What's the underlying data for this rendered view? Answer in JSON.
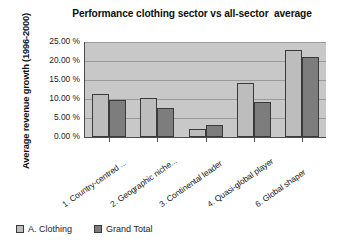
{
  "chart_data": {
    "type": "bar",
    "title": "Performance clothing sector vs all-sector  average",
    "xlabel": "",
    "ylabel": "Average revenue growth (1996-2000)",
    "categories": [
      "1. Country-centred ...",
      "2. Geographic niche...",
      "3. Continental leader",
      "4. Quasi-global player",
      "6. Global shaper"
    ],
    "series": [
      {
        "name": "A. Clothing",
        "color": "#bdbdbd",
        "values": [
          11.3,
          10.2,
          2.0,
          14.2,
          23.0
        ]
      },
      {
        "name": "Grand Total",
        "color": "#7d7d7d",
        "values": [
          9.7,
          7.7,
          3.2,
          9.3,
          21.0
        ]
      }
    ],
    "ylim": [
      0,
      25
    ],
    "ytick_values": [
      0,
      5,
      10,
      15,
      20,
      25
    ],
    "ytick_labels": [
      "0.00 %",
      "5.00 %",
      "10.00 %",
      "15.00 %",
      "20.00 %",
      "25.00 %"
    ],
    "grid": true,
    "legend_position": "bottom-left",
    "plot_background": "#c8c8c8",
    "axis_color": "#4d4d4d",
    "gridline_color": "#9a9a9a"
  }
}
